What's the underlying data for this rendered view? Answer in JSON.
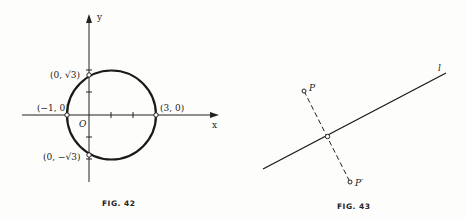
{
  "fig42": {
    "caption": "FIG. 42",
    "axis_x_label": "x",
    "axis_y_label": "y",
    "origin_label": "O",
    "points": [
      {
        "label": "(0, √3)"
      },
      {
        "label": "(−1, 0)"
      },
      {
        "label": "(3, 0)"
      },
      {
        "label": "(0, −√3)"
      }
    ]
  },
  "fig43": {
    "caption": "FIG. 43",
    "line_label": "l",
    "point_p": "P",
    "point_p_prime": "P′"
  }
}
